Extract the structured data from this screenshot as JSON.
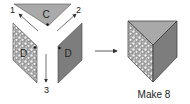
{
  "diagram": {
    "net": {
      "triangle_label": "C",
      "left_face_label": "D",
      "right_face_label": "D",
      "fold_labels": [
        "1",
        "2",
        "3"
      ]
    },
    "result": {
      "caption": "Make 8"
    },
    "colors": {
      "triangle_fill": "#a9a9a9",
      "speckle_face_base": "#9a9a9a",
      "speckle_face_dots": "#f2f2f2",
      "gray_face_fill": "#7d7d7d",
      "outline": "#333333",
      "arrow": "#333333"
    }
  }
}
